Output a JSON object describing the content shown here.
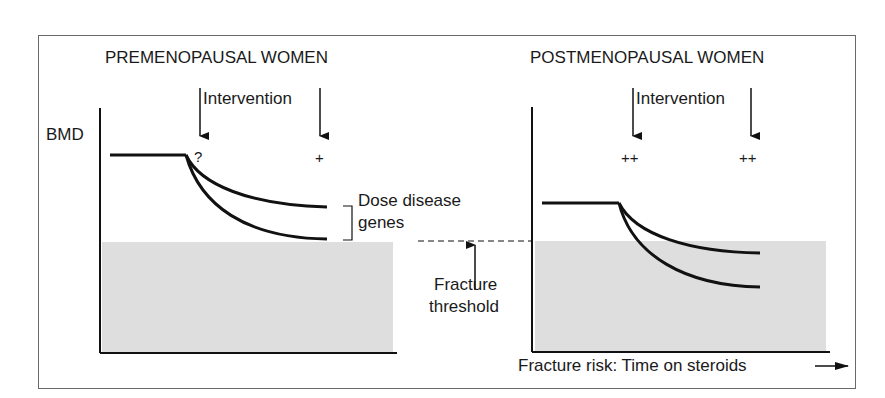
{
  "left_panel": {
    "title": "PREMENOPAUSAL WOMEN",
    "y_axis_label": "BMD",
    "intervention_label": "Intervention",
    "early_marker": "?",
    "late_marker": "+"
  },
  "right_panel": {
    "title": "POSTMENOPAUSAL WOMEN",
    "intervention_label": "Intervention",
    "early_marker": "++",
    "late_marker": "++",
    "x_axis_label": "Fracture risk: Time on steroids"
  },
  "annotations": {
    "bracket_label_line1": "Dose disease",
    "bracket_label_line2": "genes",
    "threshold_label_line1": "Fracture",
    "threshold_label_line2": "threshold"
  },
  "colors": {
    "line": "#111111",
    "shaded_region": "#dedede",
    "frame": "#6a6a6a"
  }
}
